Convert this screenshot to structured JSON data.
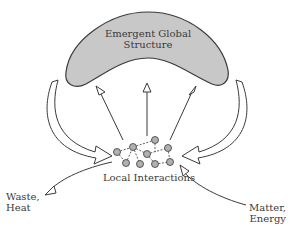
{
  "diagram": {
    "global_structure_label_line1": "Emergent Global",
    "global_structure_label_line2": "Structure",
    "local_label": "Local Interactions",
    "output_label_line1": "Waste,",
    "output_label_line2": "Heat",
    "input_label_line1": "Matter,",
    "input_label_line2": "Energy",
    "colors": {
      "blob_fill": "#c8c8c8",
      "stroke": "#3a3a3a",
      "node_fill": "#b0b0b0"
    }
  }
}
